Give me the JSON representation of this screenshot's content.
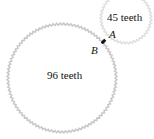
{
  "diagram": {
    "large_gear": {
      "label": "96 teeth",
      "teeth": 96
    },
    "small_gear": {
      "label": "45 teeth",
      "teeth": 45
    },
    "points": {
      "a": "A",
      "b": "B"
    },
    "colors": {
      "gear": "#c8c8c8",
      "contact": "#111111",
      "text": "#111111"
    }
  }
}
